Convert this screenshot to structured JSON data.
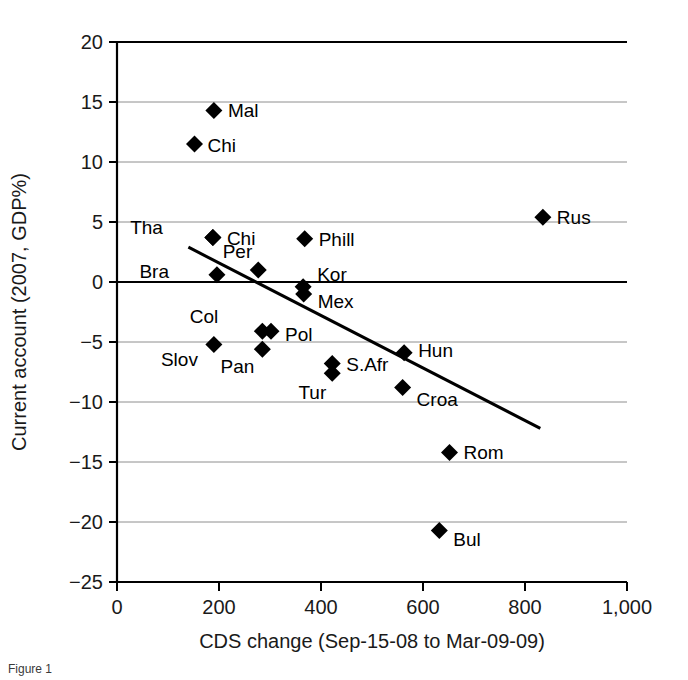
{
  "figure": {
    "caption": "Figure 1"
  },
  "chart_data": {
    "type": "scatter",
    "title": "",
    "xlabel": "CDS change (Sep-15-08 to Mar-09-09)",
    "ylabel": "Current account (2007, GDP%)",
    "xlim": [
      0,
      1000
    ],
    "ylim": [
      -25,
      20
    ],
    "xticks": [
      0,
      200,
      400,
      600,
      800,
      1000
    ],
    "xticklabels": [
      "0",
      "200",
      "400",
      "600",
      "800",
      "1,000"
    ],
    "yticks": [
      20,
      15,
      10,
      5,
      0,
      -5,
      -10,
      -15,
      -20,
      -25
    ],
    "yticklabels": [
      "20",
      "15",
      "10",
      "5",
      "0",
      "−5",
      "−10",
      "−15",
      "−20",
      "−25"
    ],
    "grid": "horizontal",
    "legend": "none",
    "zero_line": 0,
    "points": [
      {
        "label": "Mal",
        "x": 190,
        "y": 14.3,
        "lx": 14,
        "ly": 7
      },
      {
        "label": "Chi",
        "x": 152,
        "y": 11.5,
        "lx": 13,
        "ly": 8
      },
      {
        "label": "Rus",
        "x": 835,
        "y": 5.4,
        "lx": 14,
        "ly": 7
      },
      {
        "label": "Tha",
        "x": 188,
        "y": 3.7,
        "lx": -50,
        "ly": -4
      },
      {
        "label": "Chi",
        "x": 188,
        "y": 3.7,
        "lx": 14,
        "ly": 7
      },
      {
        "label": "Phill",
        "x": 368,
        "y": 3.6,
        "lx": 14,
        "ly": 7
      },
      {
        "label": "Per",
        "x": 277,
        "y": 1.0,
        "lx": -6,
        "ly": -12
      },
      {
        "label": "Bra",
        "x": 196,
        "y": 0.6,
        "lx": -48,
        "ly": 3
      },
      {
        "label": "Kor",
        "x": 365,
        "y": -0.4,
        "lx": 14,
        "ly": -6
      },
      {
        "label": "Mex",
        "x": 366,
        "y": -1.0,
        "lx": 14,
        "ly": 14
      },
      {
        "label": "Col",
        "x": 285,
        "y": -4.1,
        "lx": -44,
        "ly": -8
      },
      {
        "label": "Pol",
        "x": 302,
        "y": -4.1,
        "lx": 14,
        "ly": 10
      },
      {
        "label": "Slov",
        "x": 190,
        "y": -5.2,
        "lx": -16,
        "ly": 22
      },
      {
        "label": "Pan",
        "x": 285,
        "y": -5.6,
        "lx": -8,
        "ly": 24
      },
      {
        "label": "S.Afr",
        "x": 422,
        "y": -6.8,
        "lx": 14,
        "ly": 7
      },
      {
        "label": "Hun",
        "x": 563,
        "y": -5.9,
        "lx": 14,
        "ly": 4
      },
      {
        "label": "Tur",
        "x": 422,
        "y": -7.6,
        "lx": -6,
        "ly": 26
      },
      {
        "label": "Croa",
        "x": 560,
        "y": -8.8,
        "lx": 14,
        "ly": 18
      },
      {
        "label": "Rom",
        "x": 652,
        "y": -14.2,
        "lx": 14,
        "ly": 7
      },
      {
        "label": "Bul",
        "x": 632,
        "y": -20.7,
        "lx": 14,
        "ly": 16
      }
    ],
    "trendline": {
      "x1": 140,
      "y1": 2.9,
      "x2": 830,
      "y2": -12.2
    }
  }
}
